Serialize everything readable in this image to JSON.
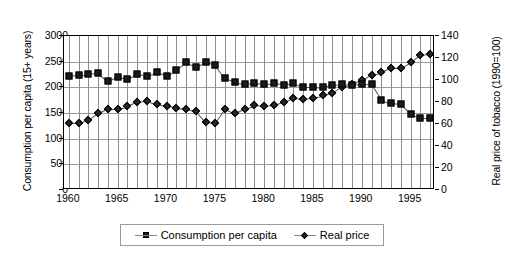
{
  "chart_data": {
    "type": "line",
    "title": "",
    "subtitle": "",
    "xlabel": "",
    "ylabel": "Consumption per capita (15+ years)",
    "y2label": "Real price of tobacco (1990=100)",
    "grid": true,
    "legend_position": "bottom",
    "xlim": [
      1959.5,
      1997.5
    ],
    "ylim": [
      0,
      3000
    ],
    "y2lim": [
      0,
      140
    ],
    "yticks": [
      0,
      500,
      1000,
      1500,
      2000,
      2500,
      3000
    ],
    "y2ticks": [
      0,
      20,
      40,
      60,
      80,
      100,
      120,
      140
    ],
    "xticks": [
      1960,
      1965,
      1970,
      1975,
      1980,
      1985,
      1990,
      1995
    ],
    "x": [
      1960,
      1961,
      1962,
      1963,
      1964,
      1965,
      1966,
      1967,
      1968,
      1969,
      1970,
      1971,
      1972,
      1973,
      1974,
      1975,
      1976,
      1977,
      1978,
      1979,
      1980,
      1981,
      1982,
      1983,
      1984,
      1985,
      1986,
      1987,
      1988,
      1989,
      1990,
      1991,
      1992,
      1993,
      1994,
      1995,
      1996,
      1997
    ],
    "series": [
      {
        "name": "Consumption per capita",
        "axis": "left",
        "marker": "square",
        "values": [
          2220,
          2250,
          2255,
          2280,
          2120,
          2205,
          2170,
          2260,
          2230,
          2295,
          2230,
          2340,
          2485,
          2390,
          2485,
          2430,
          2180,
          2110,
          2060,
          2085,
          2070,
          2075,
          2050,
          2090,
          2015,
          2015,
          2000,
          2045,
          2060,
          2040,
          2065,
          2060,
          1760,
          1690,
          1670,
          1490,
          1400,
          1400
        ]
      },
      {
        "name": "Real price",
        "axis": "right",
        "marker": "diamond",
        "values": [
          61,
          61,
          64,
          70,
          74,
          74,
          76,
          80,
          81,
          78,
          76,
          75,
          74,
          72,
          62,
          61,
          74,
          70,
          74,
          77,
          76,
          77,
          80,
          84,
          83,
          84,
          86,
          88,
          94,
          96,
          100,
          105,
          107,
          111,
          111,
          116,
          123,
          124
        ]
      }
    ]
  },
  "legend": {
    "items": [
      {
        "label": "Consumption per capita",
        "marker": "square-marker-icon"
      },
      {
        "label": "Real price",
        "marker": "diamond-marker-icon"
      }
    ]
  }
}
